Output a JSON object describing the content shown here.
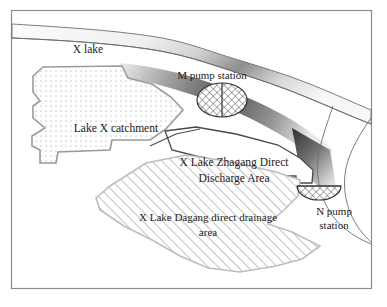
{
  "figure": {
    "kind": "schematic-map",
    "title_visible": false,
    "frame": {
      "visible": true,
      "color": "#8c8c8c"
    },
    "background_color": "#ffffff"
  },
  "labels": {
    "x_lake": "X lake",
    "m_pump_station": "M pump station",
    "lake_x_catchment": "Lake X catchment",
    "zhagang_line1": "X Lake Zhagang Direct",
    "zhagang_line2": "Discharge Area",
    "dagang_line1": "X Lake Dagang direct drainage",
    "dagang_line2": "area",
    "n_pump_line1": "N  pump",
    "n_pump_line2": "station"
  },
  "features": [
    {
      "id": "x-lake-river",
      "name": "X lake",
      "type": "water-body",
      "fill_style": "gradient-grey",
      "outline_color": "#6e6e6e"
    },
    {
      "id": "lake-x-catchment",
      "name": "Lake X catchment",
      "type": "region",
      "fill_style": "dotted-stipple",
      "outline_color": "#9a9a9a"
    },
    {
      "id": "zhagang-discharge-area",
      "name": "X Lake Zhagang Direct Discharge Area",
      "type": "region",
      "fill_style": "plain-white",
      "outline_color": "#4a4a4a"
    },
    {
      "id": "dagang-drainage-area",
      "name": "X Lake Dagang direct drainage area",
      "type": "region",
      "fill_style": "diagonal-hatch",
      "outline_color": "#bdbdbd"
    },
    {
      "id": "m-pump-station",
      "name": "M pump station",
      "type": "pump-station",
      "shape": "full-ellipse-crosshatch-with-center-line",
      "outline_color": "#333333"
    },
    {
      "id": "n-pump-station",
      "name": "N pump station",
      "type": "pump-station",
      "shape": "half-ellipse-crosshatch",
      "outline_color": "#333333"
    }
  ],
  "colors": {
    "frame": "#8c8c8c",
    "water_dark": "#4f4f4f",
    "water_light": "#f2f2f2",
    "stipple_dot": "#8a8a8a",
    "hatch_line": "#8f8f8f",
    "text": "#1a1a1a"
  }
}
